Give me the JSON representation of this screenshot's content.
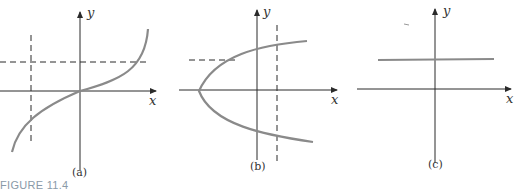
{
  "figure": {
    "caption": "FIGURE 11.4",
    "panels": [
      {
        "id": "a",
        "label": "(a)",
        "x_axis": "x",
        "y_axis": "y",
        "description": "cubic-like increasing curve through origin; vertical and horizontal dashed test lines each intersect once"
      },
      {
        "id": "b",
        "label": "(b)",
        "x_axis": "x",
        "y_axis": "y",
        "description": "sideways parabola opening right; horizontal dashed line intersects once, vertical dashed line intersects twice"
      },
      {
        "id": "c",
        "label": "(c)",
        "x_axis": "x",
        "y_axis": "y",
        "description": "horizontal constant line above x-axis"
      }
    ]
  },
  "colors": {
    "axis": "#2a2a2a",
    "curve": "#8a8a8a",
    "caption": "#8a9aa8"
  }
}
